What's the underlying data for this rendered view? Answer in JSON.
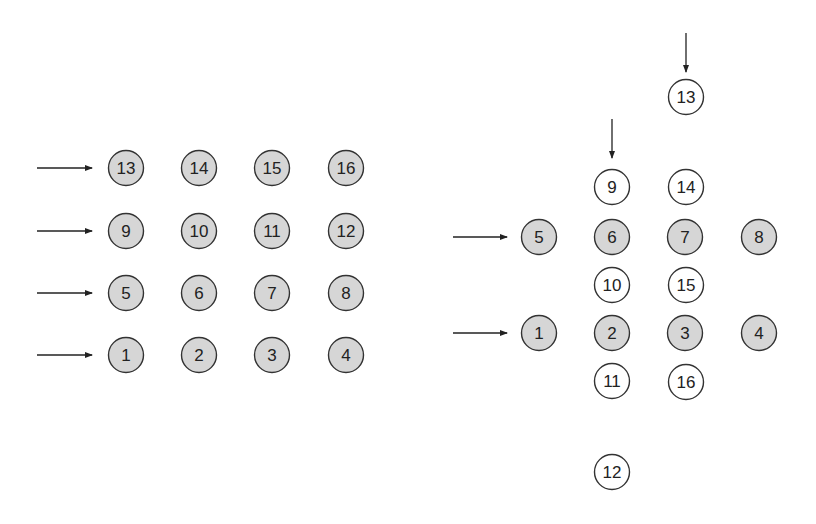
{
  "colors": {
    "filled": "#d6d6d6",
    "empty": "#ffffff",
    "stroke": "#333333",
    "arrow": "#222222"
  },
  "left_grid": {
    "nodes": [
      {
        "label": "13",
        "x": 126,
        "y": 168,
        "filled": true
      },
      {
        "label": "14",
        "x": 199,
        "y": 168,
        "filled": true
      },
      {
        "label": "15",
        "x": 272,
        "y": 168,
        "filled": true
      },
      {
        "label": "16",
        "x": 346,
        "y": 168,
        "filled": true
      },
      {
        "label": "9",
        "x": 126,
        "y": 231,
        "filled": true
      },
      {
        "label": "10",
        "x": 199,
        "y": 231,
        "filled": true
      },
      {
        "label": "11",
        "x": 272,
        "y": 231,
        "filled": true
      },
      {
        "label": "12",
        "x": 346,
        "y": 231,
        "filled": true
      },
      {
        "label": "5",
        "x": 126,
        "y": 293,
        "filled": true
      },
      {
        "label": "6",
        "x": 199,
        "y": 293,
        "filled": true
      },
      {
        "label": "7",
        "x": 272,
        "y": 293,
        "filled": true
      },
      {
        "label": "8",
        "x": 346,
        "y": 293,
        "filled": true
      },
      {
        "label": "1",
        "x": 126,
        "y": 355,
        "filled": true
      },
      {
        "label": "2",
        "x": 199,
        "y": 355,
        "filled": true
      },
      {
        "label": "3",
        "x": 272,
        "y": 355,
        "filled": true
      },
      {
        "label": "4",
        "x": 346,
        "y": 355,
        "filled": true
      }
    ],
    "arrows": [
      {
        "x1": 37,
        "y1": 168,
        "x2": 92,
        "y2": 168
      },
      {
        "x1": 37,
        "y1": 231,
        "x2": 92,
        "y2": 231
      },
      {
        "x1": 37,
        "y1": 293,
        "x2": 92,
        "y2": 293
      },
      {
        "x1": 37,
        "y1": 355,
        "x2": 92,
        "y2": 355
      }
    ]
  },
  "right_layout": {
    "nodes": [
      {
        "label": "13",
        "x": 686,
        "y": 97,
        "filled": false
      },
      {
        "label": "9",
        "x": 612,
        "y": 187,
        "filled": false
      },
      {
        "label": "14",
        "x": 686,
        "y": 187,
        "filled": false
      },
      {
        "label": "5",
        "x": 539,
        "y": 237,
        "filled": true
      },
      {
        "label": "6",
        "x": 612,
        "y": 237,
        "filled": true
      },
      {
        "label": "7",
        "x": 685,
        "y": 237,
        "filled": true
      },
      {
        "label": "8",
        "x": 759,
        "y": 237,
        "filled": true
      },
      {
        "label": "10",
        "x": 612,
        "y": 285,
        "filled": false
      },
      {
        "label": "15",
        "x": 686,
        "y": 285,
        "filled": false
      },
      {
        "label": "1",
        "x": 539,
        "y": 333,
        "filled": true
      },
      {
        "label": "2",
        "x": 612,
        "y": 333,
        "filled": true
      },
      {
        "label": "3",
        "x": 685,
        "y": 333,
        "filled": true
      },
      {
        "label": "4",
        "x": 759,
        "y": 333,
        "filled": true
      },
      {
        "label": "11",
        "x": 612,
        "y": 381,
        "filled": false
      },
      {
        "label": "16",
        "x": 686,
        "y": 382,
        "filled": false
      },
      {
        "label": "12",
        "x": 612,
        "y": 472,
        "filled": false
      }
    ],
    "arrows": [
      {
        "x1": 686,
        "y1": 33,
        "x2": 686,
        "y2": 72
      },
      {
        "x1": 612,
        "y1": 119,
        "x2": 612,
        "y2": 158
      },
      {
        "x1": 453,
        "y1": 237,
        "x2": 507,
        "y2": 237
      },
      {
        "x1": 453,
        "y1": 333,
        "x2": 507,
        "y2": 333
      }
    ]
  }
}
